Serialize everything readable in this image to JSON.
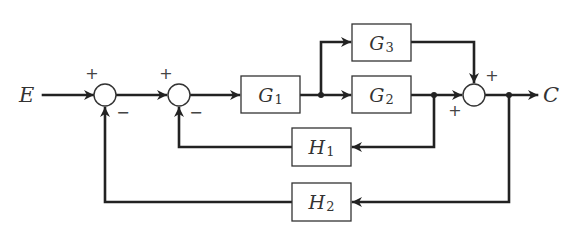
{
  "diagram": {
    "type": "block-diagram",
    "input": {
      "label": "E"
    },
    "output": {
      "label": "C"
    },
    "blocks": [
      {
        "id": "G1",
        "symbol": "G",
        "subscript": "1"
      },
      {
        "id": "G2",
        "symbol": "G",
        "subscript": "2"
      },
      {
        "id": "G3",
        "symbol": "G",
        "subscript": "3"
      },
      {
        "id": "H1",
        "symbol": "H",
        "subscript": "1"
      },
      {
        "id": "H2",
        "symbol": "H",
        "subscript": "2"
      }
    ],
    "junctions": [
      {
        "id": "S1",
        "signs": {
          "input": "+",
          "feedback": "−"
        }
      },
      {
        "id": "S2",
        "signs": {
          "input": "+",
          "feedback": "−"
        }
      },
      {
        "id": "S3",
        "signs": {
          "top": "+",
          "left": "+"
        }
      }
    ],
    "connections": [
      "E → S1 (+)",
      "S1 → S2 (+)",
      "S2 → G1",
      "G1 → branch → G2",
      "G1 → branch → G3",
      "G2 → S3 (+)",
      "G3 → S3 (+)",
      "S3 → C",
      "G2 output → H1 → S2 (−)",
      "C → H2 → S1 (−)"
    ]
  },
  "colors": {
    "line": "#222222",
    "background": "#ffffff"
  }
}
